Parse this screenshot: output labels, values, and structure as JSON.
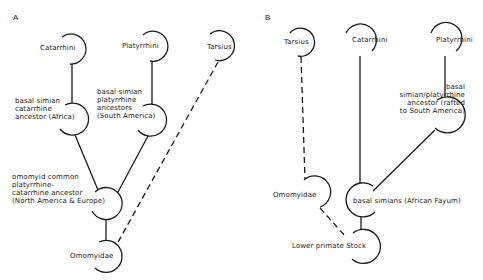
{
  "panels": {
    "a": {
      "label": "A",
      "nodes": {
        "catarrhini": "Catarrhini",
        "platyrrhini": "Platyrrhini",
        "tarsius": "Tarsius",
        "africa": "basal simian\ncatarrhine\nancestor (Africa)",
        "south_america": "basal simian\nplatyrrhine\nancestors\n(South America)",
        "common": "omomyid common\nplatyrrhine-\ncatarrhine ancestor\n(North America & Europe)",
        "omomyidae": "Omomyidae"
      }
    },
    "b": {
      "label": "B",
      "nodes": {
        "tarsius": "Tarsius",
        "catarrhini": "Catarrhini",
        "platyrrhini": "Platyrrhini",
        "rafted": "basal\nsimian/platyrrhine\nancestor (rafted\nto South America)",
        "omomyidae": "Omomyidae",
        "basal_simians": "basal simians (African Fayum)",
        "stock": "Lower primate Stock"
      }
    }
  },
  "colors": {
    "line": "#1a1a1a",
    "background": "#ffffff"
  }
}
